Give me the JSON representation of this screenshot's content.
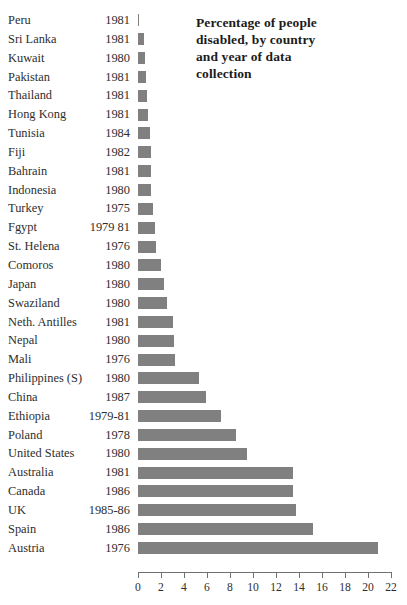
{
  "title": {
    "line1": "Percentage of people",
    "line2": "disabled, by country",
    "line3": "and year of data",
    "line4": "collection",
    "full": "Percentage of people disabled, by country and year of data collection"
  },
  "colors": {
    "bar": "#808080",
    "axis": "#6f6f6f",
    "text": "#2e2e2e",
    "title": "#1c1c1c",
    "background": "#ffffff"
  },
  "chart_data": {
    "type": "bar",
    "orientation": "horizontal",
    "title": "Percentage of people disabled, by country and year of data collection",
    "xlabel": "",
    "ylabel": "",
    "xlim": [
      0,
      22
    ],
    "xticks": [
      0,
      2,
      4,
      6,
      8,
      10,
      12,
      14,
      16,
      18,
      20,
      22
    ],
    "grid": false,
    "legend": false,
    "categories": [
      "Peru",
      "Sri Lanka",
      "Kuwait",
      "Pakistan",
      "Thailand",
      "Hong Kong",
      "Tunisia",
      "Fiji",
      "Bahrain",
      "Indonesia",
      "Turkey",
      "Fgypt",
      "St. Helena",
      "Comoros",
      "Japan",
      "Swaziland",
      "Neth. Antilles",
      "Nepal",
      "Mali",
      "Philippines (S)",
      "China",
      "Ethiopia",
      "Poland",
      "United States",
      "Australia",
      "Canada",
      "UK",
      "Spain",
      "Austria"
    ],
    "years": [
      "1981",
      "1981",
      "1980",
      "1981",
      "1981",
      "1981",
      "1984",
      "1982",
      "1981",
      "1980",
      "1975",
      "1979 81",
      "1976",
      "1980",
      "1980",
      "1980",
      "1981",
      "1980",
      "1976",
      "1980",
      "1987",
      "1979-81",
      "1978",
      "1980",
      "1981",
      "1986",
      "1985-86",
      "1986",
      "1976"
    ],
    "values": [
      0.1,
      0.5,
      0.6,
      0.7,
      0.8,
      0.9,
      1.0,
      1.1,
      1.1,
      1.1,
      1.3,
      1.5,
      1.6,
      2.0,
      2.3,
      2.5,
      3.0,
      3.1,
      3.2,
      5.3,
      5.9,
      7.2,
      8.5,
      9.5,
      13.5,
      13.5,
      13.7,
      15.2,
      20.9
    ],
    "rows": [
      {
        "country": "Peru",
        "year": "1981",
        "value": 0.1
      },
      {
        "country": "Sri Lanka",
        "year": "1981",
        "value": 0.5
      },
      {
        "country": "Kuwait",
        "year": "1980",
        "value": 0.6
      },
      {
        "country": "Pakistan",
        "year": "1981",
        "value": 0.7
      },
      {
        "country": "Thailand",
        "year": "1981",
        "value": 0.8
      },
      {
        "country": "Hong Kong",
        "year": "1981",
        "value": 0.9
      },
      {
        "country": "Tunisia",
        "year": "1984",
        "value": 1.0
      },
      {
        "country": "Fiji",
        "year": "1982",
        "value": 1.1
      },
      {
        "country": "Bahrain",
        "year": "1981",
        "value": 1.1
      },
      {
        "country": "Indonesia",
        "year": "1980",
        "value": 1.1
      },
      {
        "country": "Turkey",
        "year": "1975",
        "value": 1.3
      },
      {
        "country": "Fgypt",
        "year": "1979 81",
        "value": 1.5
      },
      {
        "country": "St. Helena",
        "year": "1976",
        "value": 1.6
      },
      {
        "country": "Comoros",
        "year": "1980",
        "value": 2.0
      },
      {
        "country": "Japan",
        "year": "1980",
        "value": 2.3
      },
      {
        "country": "Swaziland",
        "year": "1980",
        "value": 2.5
      },
      {
        "country": "Neth. Antilles",
        "year": "1981",
        "value": 3.0
      },
      {
        "country": "Nepal",
        "year": "1980",
        "value": 3.1
      },
      {
        "country": "Mali",
        "year": "1976",
        "value": 3.2
      },
      {
        "country": "Philippines (S)",
        "year": "1980",
        "value": 5.3
      },
      {
        "country": "China",
        "year": "1987",
        "value": 5.9
      },
      {
        "country": "Ethiopia",
        "year": "1979-81",
        "value": 7.2
      },
      {
        "country": "Poland",
        "year": "1978",
        "value": 8.5
      },
      {
        "country": "United States",
        "year": "1980",
        "value": 9.5
      },
      {
        "country": "Australia",
        "year": "1981",
        "value": 13.5
      },
      {
        "country": "Canada",
        "year": "1986",
        "value": 13.5
      },
      {
        "country": "UK",
        "year": "1985-86",
        "value": 13.7
      },
      {
        "country": "Spain",
        "year": "1986",
        "value": 15.2
      },
      {
        "country": "Austria",
        "year": "1976",
        "value": 20.9
      }
    ]
  }
}
